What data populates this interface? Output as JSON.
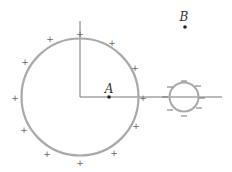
{
  "diagram": {
    "labels": {
      "point_a": "A",
      "point_b": "B"
    },
    "large_sphere": {
      "charge_sign": "+",
      "count": 12,
      "color": "#a9a9a9"
    },
    "small_sphere": {
      "charge_sign": "−",
      "count": 10,
      "color": "#a9a9a9"
    },
    "axis_color": "#707070"
  }
}
